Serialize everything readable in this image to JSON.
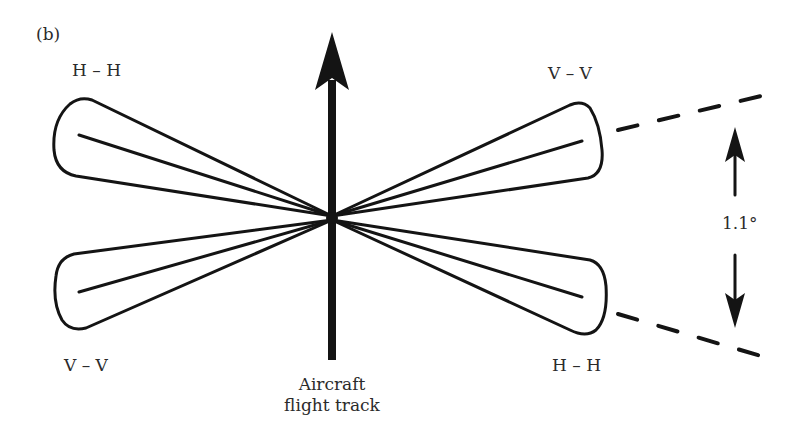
{
  "panel_label": "(b)",
  "labels": {
    "top_left": "H – H",
    "top_right": "V – V",
    "bottom_left": "V – V",
    "bottom_right": "H – H"
  },
  "angle_label": "1.1°",
  "caption": {
    "line1": "Aircraft",
    "line2": "flight track"
  },
  "colors": {
    "stroke": "#141414",
    "text": "#2b2b2b",
    "background": "#ffffff"
  }
}
